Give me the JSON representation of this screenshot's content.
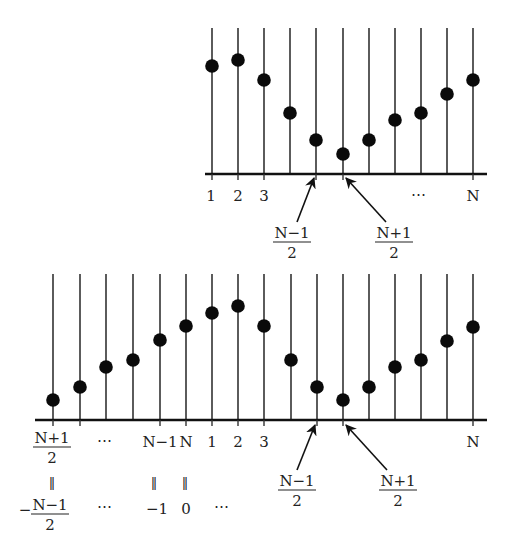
{
  "top_diagram": {
    "axis": {
      "y": 174,
      "x1": 205,
      "x2": 487,
      "line_top": 28
    },
    "stems": [
      {
        "x": 212,
        "dot_y": 66
      },
      {
        "x": 238,
        "dot_y": 60
      },
      {
        "x": 264,
        "dot_y": 80
      },
      {
        "x": 290,
        "dot_y": 113
      },
      {
        "x": 316,
        "dot_y": 140
      },
      {
        "x": 343,
        "dot_y": 154
      },
      {
        "x": 369,
        "dot_y": 140
      },
      {
        "x": 395,
        "dot_y": 120
      },
      {
        "x": 421,
        "dot_y": 113
      },
      {
        "x": 447,
        "dot_y": 94
      },
      {
        "x": 473,
        "dot_y": 80
      }
    ],
    "ticks_x": [
      212,
      238,
      264,
      316,
      343,
      473
    ],
    "labels": [
      {
        "text": "1",
        "x": 211,
        "y": 201
      },
      {
        "text": "2",
        "x": 238,
        "y": 201
      },
      {
        "text": "3",
        "x": 264,
        "y": 201
      },
      {
        "text": "⋯",
        "x": 418,
        "y": 199
      },
      {
        "text": "N",
        "x": 473,
        "y": 201
      }
    ],
    "arrows": [
      {
        "from": [
          297,
          222
        ],
        "to": [
          314,
          178
        ]
      },
      {
        "from": [
          386,
          222
        ],
        "to": [
          346,
          178
        ]
      }
    ],
    "fractions": [
      {
        "num": "N−1",
        "den": "2",
        "x": 292,
        "y": 238
      },
      {
        "num": "N+1",
        "den": "2",
        "x": 394,
        "y": 238
      }
    ]
  },
  "bottom_diagram": {
    "axis": {
      "y": 420,
      "x1": 35,
      "x2": 487,
      "line_top": 274
    },
    "stems": [
      {
        "x": 53,
        "dot_y": 400
      },
      {
        "x": 80,
        "dot_y": 387
      },
      {
        "x": 106,
        "dot_y": 367
      },
      {
        "x": 133,
        "dot_y": 360
      },
      {
        "x": 160,
        "dot_y": 340
      },
      {
        "x": 186,
        "dot_y": 326
      },
      {
        "x": 212,
        "dot_y": 313
      },
      {
        "x": 238,
        "dot_y": 306
      },
      {
        "x": 264,
        "dot_y": 326
      },
      {
        "x": 291,
        "dot_y": 360
      },
      {
        "x": 317,
        "dot_y": 387
      },
      {
        "x": 343,
        "dot_y": 400
      },
      {
        "x": 369,
        "dot_y": 387
      },
      {
        "x": 395,
        "dot_y": 367
      },
      {
        "x": 421,
        "dot_y": 360
      },
      {
        "x": 447,
        "dot_y": 341
      },
      {
        "x": 473,
        "dot_y": 327
      }
    ],
    "ticks_x": [
      53,
      80,
      160,
      186,
      212,
      238,
      264,
      317,
      343,
      473
    ],
    "labels": [
      {
        "text": "⋯",
        "x": 104,
        "y": 445
      },
      {
        "text": "N−1",
        "x": 160,
        "y": 447
      },
      {
        "text": "N",
        "x": 186,
        "y": 447
      },
      {
        "text": "1",
        "x": 212,
        "y": 447
      },
      {
        "text": "2",
        "x": 238,
        "y": 447
      },
      {
        "text": "3",
        "x": 264,
        "y": 447
      },
      {
        "text": "N",
        "x": 473,
        "y": 447
      }
    ],
    "equals_marks": [
      {
        "text": "‖",
        "x": 52,
        "y": 487
      },
      {
        "text": "‖",
        "x": 154,
        "y": 487
      },
      {
        "text": "‖",
        "x": 185,
        "y": 487
      }
    ],
    "second_row_labels": [
      {
        "text": "⋯",
        "x": 104,
        "y": 511
      },
      {
        "text": "−1",
        "x": 157,
        "y": 514
      },
      {
        "text": "0",
        "x": 186,
        "y": 514
      },
      {
        "text": "⋯",
        "x": 221,
        "y": 511
      }
    ],
    "arrows": [
      {
        "from": [
          297,
          470
        ],
        "to": [
          315,
          425
        ]
      },
      {
        "from": [
          387,
          470
        ],
        "to": [
          346,
          425
        ]
      }
    ],
    "fractions": [
      {
        "num": "N+1",
        "den": "2",
        "x": 52,
        "y": 443,
        "prefix": ""
      },
      {
        "num": "N−1",
        "den": "2",
        "x": 50,
        "y": 510,
        "prefix": "−"
      },
      {
        "num": "N−1",
        "den": "2",
        "x": 297,
        "y": 486,
        "prefix": ""
      },
      {
        "num": "N+1",
        "den": "2",
        "x": 398,
        "y": 486,
        "prefix": ""
      }
    ]
  }
}
